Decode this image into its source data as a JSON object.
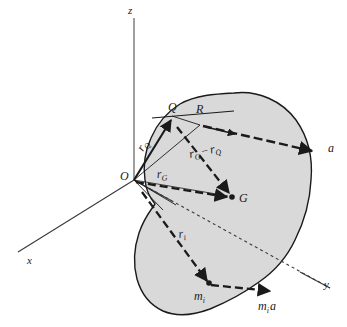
{
  "figure": {
    "background_color": "#ffffff",
    "body_fill_color": "#d9d9d9",
    "body_stroke_color": "#1a1a1a",
    "line_color": "#1a1a1a"
  },
  "axes": {
    "z": {
      "label": "z"
    },
    "x": {
      "label": "x"
    },
    "y": {
      "label": "y"
    }
  },
  "points": {
    "origin": {
      "label": "O"
    },
    "q": {
      "label": "Q"
    },
    "r": {
      "label": "R"
    },
    "g": {
      "label": "G"
    },
    "mi": {
      "label": "m",
      "subscript": "i"
    }
  },
  "vectors": {
    "r_q": {
      "label": "r",
      "subscript": "Q"
    },
    "r_g": {
      "label": "r",
      "subscript": "G"
    },
    "r_g_minus_r_q": {
      "first": "r",
      "first_sub": "G",
      "operator": "−",
      "second": "r",
      "second_sub": "Q"
    },
    "r_i": {
      "label": "r",
      "subscript": "i"
    },
    "a": {
      "label": "a"
    },
    "mi_a": {
      "label": "m",
      "subscript": "i",
      "suffix": "a"
    }
  }
}
